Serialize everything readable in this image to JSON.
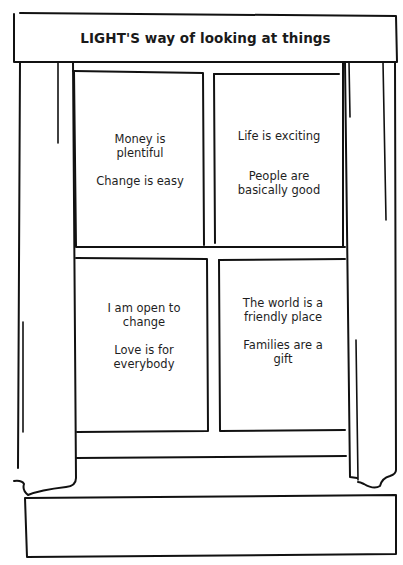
{
  "header": {
    "title": "LIGHT'S way of looking at things"
  },
  "window": {
    "panes": [
      {
        "position": "top-left",
        "statements": [
          [
            "Money is",
            "plentiful"
          ],
          [
            "Change is easy"
          ]
        ]
      },
      {
        "position": "top-right",
        "statements": [
          [
            "Life is exciting"
          ],
          [
            "People are",
            "basically good"
          ]
        ]
      },
      {
        "position": "bottom-left",
        "statements": [
          [
            "I am open to",
            "change"
          ],
          [
            "Love is for",
            "everybody"
          ]
        ]
      },
      {
        "position": "bottom-right",
        "statements": [
          [
            "The world is a",
            "friendly place"
          ],
          [
            "Families are a",
            "gift"
          ]
        ]
      }
    ]
  },
  "colors": {
    "ink": "#111111",
    "background": "#ffffff"
  }
}
